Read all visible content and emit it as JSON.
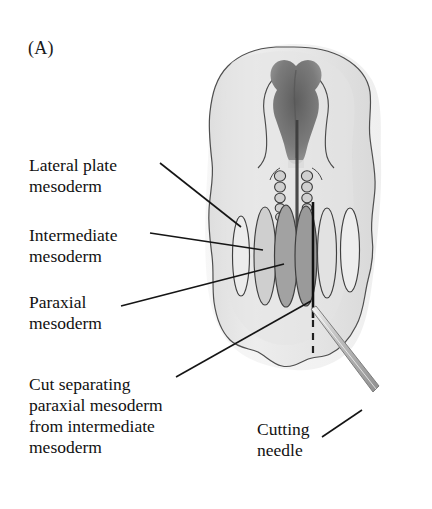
{
  "figure": {
    "panel_label": "(A)",
    "background_color": "#ffffff",
    "ink_color": "#1a1a1a"
  },
  "labels": {
    "lateral_plate": "Lateral plate\nmesoderm",
    "intermediate": "Intermediate\nmesoderm",
    "paraxial": "Paraxial\nmesoderm",
    "cut": "Cut separating\nparaxial mesoderm\nfrom intermediate\nmesoderm",
    "cutting_needle": "Cutting\nneedle"
  },
  "structures": {
    "embryo_outline": "embryo-body-outline",
    "head_fold": "head-fold-neural-plate",
    "neural_tube": "neural-tube-midline",
    "somites_left": 5,
    "somites_right": 5,
    "mesoderm_bands": 6,
    "cut_line": "solid-cut-line",
    "cut_line_dashed": "dashed-cut-extension",
    "needle": "cutting-needle-shaft"
  },
  "colors": {
    "embryo_fill": "#e9e9e9",
    "embryo_edge": "#4a4a4a",
    "paraxial_fill": "#9a9a9a",
    "intermediate_fill": "#bdbdbd",
    "lateral_fill": "#eeeeee",
    "head_dark": "#6e6e6e",
    "needle_fill": "#c9c9c9",
    "leader_line": "#1a1a1a"
  }
}
